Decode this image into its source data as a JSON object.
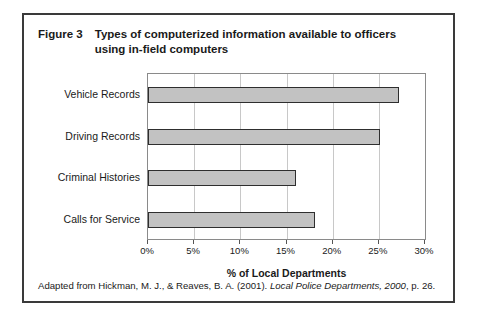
{
  "figure": {
    "label": "Figure 3",
    "caption": "Types of computerized information available to officers using in-field computers",
    "source_prefix": "Adapted from Hickman, M. J., & Reaves, B. A. (2001).",
    "source_italic": "Local Police Departments, 2000",
    "source_suffix": ", p. 26."
  },
  "colors": {
    "frame_border": "#3a3a3a",
    "bar_fill": "#c2c2c2",
    "bar_stroke": "#2e2e2e",
    "gridline": "#c8c8c8",
    "plot_border": "#8a8a8a",
    "text": "#1a1a1a",
    "background": "#ffffff"
  },
  "chart_data": {
    "type": "bar",
    "orientation": "horizontal",
    "title": "Types of computerized information available to officers using in-field computers",
    "categories": [
      "Vehicle Records",
      "Driving Records",
      "Criminal Histories",
      "Calls for Service"
    ],
    "values": [
      27.2,
      25.1,
      16.0,
      18.1
    ],
    "xlabel": "% of Local Departments",
    "ylabel": "",
    "xlim": [
      0,
      30
    ],
    "xticks": [
      0,
      5,
      10,
      15,
      20,
      25,
      30
    ],
    "xticklabels": [
      "0%",
      "5%",
      "10%",
      "15%",
      "20%",
      "25%",
      "30%"
    ],
    "grid": "vertical",
    "legend": "none",
    "series": [
      {
        "name": "% of Local Departments",
        "values": [
          27.2,
          25.1,
          16.0,
          18.1
        ]
      }
    ]
  }
}
